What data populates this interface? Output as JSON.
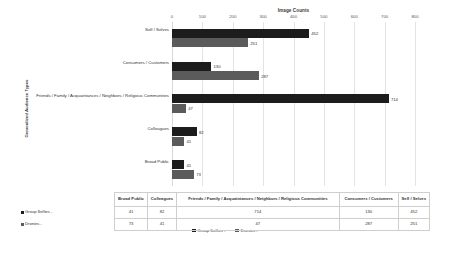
{
  "chart_data": {
    "type": "bar",
    "orientation": "horizontal",
    "title": "",
    "xlabel": "Image Counts",
    "ylabel": "Generalized Audience Types",
    "xlim": [
      0,
      800
    ],
    "xticks": [
      "0",
      "100",
      "200",
      "300",
      "400",
      "500",
      "600",
      "700",
      "800"
    ],
    "xtick_values": [
      0,
      100,
      200,
      300,
      400,
      500,
      600,
      700,
      800
    ],
    "grid": true,
    "legend_position": "bottom",
    "categories": [
      "Self / Selves",
      "Consumers / Customers",
      "Friends / Family / Acquaintances / Neighbors / Religious Communities",
      "Colleagues",
      "Broad Public"
    ],
    "series": [
      {
        "name": "Group Selfies -",
        "color": "#1c1c1c",
        "values": [
          452,
          130,
          714,
          82,
          41
        ]
      },
      {
        "name": "Dronies -",
        "color": "#5b5b5b",
        "values": [
          251,
          287,
          47,
          41,
          73
        ]
      }
    ]
  },
  "table": {
    "columns": [
      "Broad Public",
      "Colleagues",
      "Friends / Family / Acquaintances / Neighbors / Religious Communities",
      "Consumers / Customers",
      "Self / Selves"
    ],
    "rows": [
      {
        "label": "Group Selfies -",
        "color": "#1c1c1c",
        "values": [
          "41",
          "82",
          "714",
          "130",
          "452"
        ]
      },
      {
        "label": "Dronies -",
        "color": "#5b5b5b",
        "values": [
          "73",
          "41",
          "47",
          "287",
          "251"
        ]
      }
    ]
  }
}
